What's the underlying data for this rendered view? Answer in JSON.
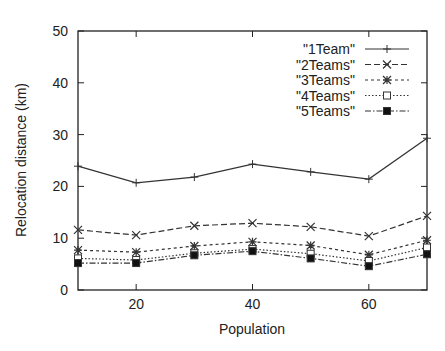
{
  "chart_data": {
    "type": "line",
    "title": "",
    "xlabel": "Population",
    "ylabel": "Relocation distance (km)",
    "xlim": [
      10,
      70
    ],
    "ylim": [
      0,
      50
    ],
    "x_ticks": [
      20,
      40,
      60
    ],
    "y_ticks": [
      0,
      10,
      20,
      30,
      40,
      50
    ],
    "grid": false,
    "legend_position": "top-right",
    "x": [
      10,
      20,
      30,
      40,
      50,
      60,
      70
    ],
    "series": [
      {
        "name": "\"1Team\"",
        "marker": "plus",
        "dash": "solid",
        "values": [
          23.9,
          20.7,
          21.8,
          24.3,
          22.8,
          21.4,
          29.3
        ]
      },
      {
        "name": "\"2Teams\"",
        "marker": "x",
        "dash": "dashed",
        "values": [
          11.6,
          10.6,
          12.4,
          12.9,
          12.2,
          10.4,
          14.3
        ]
      },
      {
        "name": "\"3Teams\"",
        "marker": "star",
        "dash": "short-dashed",
        "values": [
          7.7,
          7.3,
          8.5,
          9.3,
          8.6,
          6.8,
          9.6
        ]
      },
      {
        "name": "\"4Teams\"",
        "marker": "open-square",
        "dash": "dotted",
        "values": [
          6.1,
          5.8,
          7.1,
          7.9,
          7.0,
          5.6,
          8.2
        ]
      },
      {
        "name": "\"5Teams\"",
        "marker": "filled-square",
        "dash": "dash-dot",
        "values": [
          5.2,
          5.2,
          6.7,
          7.5,
          6.1,
          4.6,
          6.9
        ]
      }
    ]
  },
  "colors": {
    "line": "#333333",
    "axis": "#222222",
    "background": "#ffffff"
  }
}
